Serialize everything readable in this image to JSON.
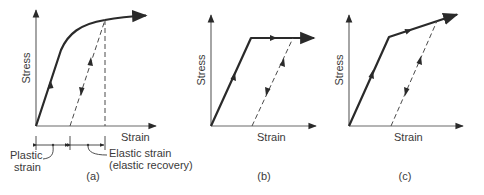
{
  "figure": {
    "panels": [
      {
        "id": "a",
        "caption": "(a)",
        "y_label": "Stress",
        "x_label": "Strain",
        "curve_type": "nonlinear hardening",
        "annotations": {
          "plastic": "Plastic",
          "plastic_2": "strain",
          "elastic": "Elastic strain",
          "elastic_2": "(elastic recovery)"
        }
      },
      {
        "id": "b",
        "caption": "(b)",
        "y_label": "Stress",
        "x_label": "Strain",
        "curve_type": "elastic-perfectly plastic"
      },
      {
        "id": "c",
        "caption": "(c)",
        "y_label": "Stress",
        "x_label": "Strain",
        "curve_type": "bilinear (linear hardening)"
      }
    ],
    "colors": {
      "curve": "#2a2a2a",
      "axis": "#6a6a6a",
      "text": "#3a3a3a",
      "background": "#ffffff"
    }
  }
}
